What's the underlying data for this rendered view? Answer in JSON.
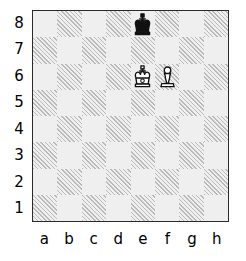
{
  "diagram": {
    "kind": "chess-board-diagram",
    "orientation": "white-bottom",
    "files": [
      "a",
      "b",
      "c",
      "d",
      "e",
      "f",
      "g",
      "h"
    ],
    "ranks": [
      "8",
      "7",
      "6",
      "5",
      "4",
      "3",
      "2",
      "1"
    ],
    "colors": {
      "light_square": "#efefef",
      "dark_square_hatch": "#b9b9b9",
      "border": "#2b2b2b",
      "label_text": "#000000",
      "piece_outline": "#111111",
      "white_piece_fill": "#ffffff",
      "black_piece_fill": "#111111"
    },
    "squares": [
      {
        "square": "a8",
        "shade": "light",
        "piece": null
      },
      {
        "square": "b8",
        "shade": "dark",
        "piece": null
      },
      {
        "square": "c8",
        "shade": "light",
        "piece": null
      },
      {
        "square": "d8",
        "shade": "dark",
        "piece": null
      },
      {
        "square": "e8",
        "shade": "light",
        "piece": "black-king"
      },
      {
        "square": "f8",
        "shade": "dark",
        "piece": null
      },
      {
        "square": "g8",
        "shade": "light",
        "piece": null
      },
      {
        "square": "h8",
        "shade": "dark",
        "piece": null
      },
      {
        "square": "a7",
        "shade": "dark",
        "piece": null
      },
      {
        "square": "b7",
        "shade": "light",
        "piece": null
      },
      {
        "square": "c7",
        "shade": "dark",
        "piece": null
      },
      {
        "square": "d7",
        "shade": "light",
        "piece": null
      },
      {
        "square": "e7",
        "shade": "dark",
        "piece": null
      },
      {
        "square": "f7",
        "shade": "light",
        "piece": null
      },
      {
        "square": "g7",
        "shade": "dark",
        "piece": null
      },
      {
        "square": "h7",
        "shade": "light",
        "piece": null
      },
      {
        "square": "a6",
        "shade": "light",
        "piece": null
      },
      {
        "square": "b6",
        "shade": "dark",
        "piece": null
      },
      {
        "square": "c6",
        "shade": "light",
        "piece": null
      },
      {
        "square": "d6",
        "shade": "dark",
        "piece": null
      },
      {
        "square": "e6",
        "shade": "light",
        "piece": "white-king"
      },
      {
        "square": "f6",
        "shade": "dark",
        "piece": "white-pawn"
      },
      {
        "square": "g6",
        "shade": "light",
        "piece": null
      },
      {
        "square": "h6",
        "shade": "dark",
        "piece": null
      },
      {
        "square": "a5",
        "shade": "dark",
        "piece": null
      },
      {
        "square": "b5",
        "shade": "light",
        "piece": null
      },
      {
        "square": "c5",
        "shade": "dark",
        "piece": null
      },
      {
        "square": "d5",
        "shade": "light",
        "piece": null
      },
      {
        "square": "e5",
        "shade": "dark",
        "piece": null
      },
      {
        "square": "f5",
        "shade": "light",
        "piece": null
      },
      {
        "square": "g5",
        "shade": "dark",
        "piece": null
      },
      {
        "square": "h5",
        "shade": "light",
        "piece": null
      },
      {
        "square": "a4",
        "shade": "light",
        "piece": null
      },
      {
        "square": "b4",
        "shade": "dark",
        "piece": null
      },
      {
        "square": "c4",
        "shade": "light",
        "piece": null
      },
      {
        "square": "d4",
        "shade": "dark",
        "piece": null
      },
      {
        "square": "e4",
        "shade": "light",
        "piece": null
      },
      {
        "square": "f4",
        "shade": "dark",
        "piece": null
      },
      {
        "square": "g4",
        "shade": "light",
        "piece": null
      },
      {
        "square": "h4",
        "shade": "dark",
        "piece": null
      },
      {
        "square": "a3",
        "shade": "dark",
        "piece": null
      },
      {
        "square": "b3",
        "shade": "light",
        "piece": null
      },
      {
        "square": "c3",
        "shade": "dark",
        "piece": null
      },
      {
        "square": "d3",
        "shade": "light",
        "piece": null
      },
      {
        "square": "e3",
        "shade": "dark",
        "piece": null
      },
      {
        "square": "f3",
        "shade": "light",
        "piece": null
      },
      {
        "square": "g3",
        "shade": "dark",
        "piece": null
      },
      {
        "square": "h3",
        "shade": "light",
        "piece": null
      },
      {
        "square": "a2",
        "shade": "light",
        "piece": null
      },
      {
        "square": "b2",
        "shade": "dark",
        "piece": null
      },
      {
        "square": "c2",
        "shade": "light",
        "piece": null
      },
      {
        "square": "d2",
        "shade": "dark",
        "piece": null
      },
      {
        "square": "e2",
        "shade": "light",
        "piece": null
      },
      {
        "square": "f2",
        "shade": "dark",
        "piece": null
      },
      {
        "square": "g2",
        "shade": "light",
        "piece": null
      },
      {
        "square": "h2",
        "shade": "dark",
        "piece": null
      },
      {
        "square": "a1",
        "shade": "dark",
        "piece": null
      },
      {
        "square": "b1",
        "shade": "light",
        "piece": null
      },
      {
        "square": "c1",
        "shade": "dark",
        "piece": null
      },
      {
        "square": "d1",
        "shade": "light",
        "piece": null
      },
      {
        "square": "e1",
        "shade": "dark",
        "piece": null
      },
      {
        "square": "f1",
        "shade": "light",
        "piece": null
      },
      {
        "square": "g1",
        "shade": "dark",
        "piece": null
      },
      {
        "square": "h1",
        "shade": "light",
        "piece": null
      }
    ],
    "pieces_on_board": [
      {
        "piece": "black-king",
        "square": "e8",
        "color": "black",
        "type": "king"
      },
      {
        "piece": "white-king",
        "square": "e6",
        "color": "white",
        "type": "king"
      },
      {
        "piece": "white-pawn",
        "square": "f6",
        "color": "white",
        "type": "pawn"
      }
    ]
  }
}
